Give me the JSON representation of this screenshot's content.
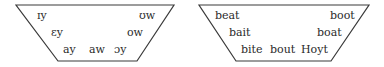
{
  "diagrams": [
    {
      "name": "phonetic-symbols",
      "labels": {
        "front_high": "ɪy",
        "back_high": "ʊw",
        "front_mid": "ɛy",
        "back_mid": "ow",
        "low_1": "ay",
        "low_2": "aw",
        "low_3": "ɔy"
      }
    },
    {
      "name": "example-words",
      "labels": {
        "front_high": "beat",
        "back_high": "boot",
        "front_mid": "bait",
        "back_mid": "boat",
        "low_1": "bite",
        "low_2": "bout",
        "low_3": "Hoyt"
      }
    }
  ],
  "colors": {
    "line": "#3a3a3a",
    "text": "#2a2a2a",
    "background": "#ffffff"
  }
}
